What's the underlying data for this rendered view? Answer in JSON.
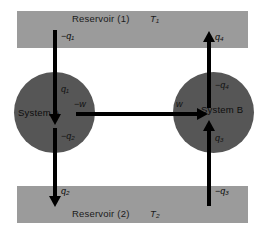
{
  "diagram": {
    "type": "thermodynamic-flow-diagram",
    "colors": {
      "background": "#ffffff",
      "reservoir_fill": "#9b9b9b",
      "system_fill": "#565656",
      "arrow": "#000000",
      "text": "#0d0d0d"
    }
  },
  "reservoirs": [
    {
      "id": "reservoir-1",
      "name": "Reservoir (1)",
      "temperature": "T₁",
      "position": "top"
    },
    {
      "id": "reservoir-2",
      "name": "Reservoir (2)",
      "temperature": "T₂",
      "position": "bottom"
    }
  ],
  "systems": [
    {
      "id": "system-a",
      "name": "System A",
      "position": "left"
    },
    {
      "id": "system-b",
      "name": "System B",
      "position": "right"
    }
  ],
  "flows": [
    {
      "id": "q1",
      "label_source": "−q₁",
      "label_target": "q₁",
      "direction": "down",
      "from": "reservoir-1",
      "to": "system-a",
      "quantity": "heat"
    },
    {
      "id": "q2",
      "label_source": "−q₂",
      "label_target": "q₂",
      "direction": "down",
      "from": "system-a",
      "to": "reservoir-2",
      "quantity": "heat"
    },
    {
      "id": "q3",
      "label_source": "−q₃",
      "label_target": "q₃",
      "direction": "up",
      "from": "reservoir-2",
      "to": "system-b",
      "quantity": "heat"
    },
    {
      "id": "q4",
      "label_source": "−q₄",
      "label_target": "q₄",
      "direction": "up",
      "from": "system-b",
      "to": "reservoir-1",
      "quantity": "heat"
    },
    {
      "id": "w",
      "label_source": "−w",
      "label_target": "w",
      "direction": "right",
      "from": "system-a",
      "to": "system-b",
      "quantity": "work"
    }
  ]
}
